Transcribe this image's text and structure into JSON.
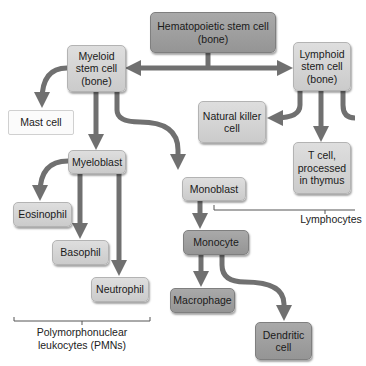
{
  "diagram": {
    "nodes": {
      "hematopoietic": "Hematopoietic stem cell\n(bone)",
      "myeloid": "Myeloid\nstem cell\n(bone)",
      "lymphoid": "Lymphoid\nstem cell\n(bone)",
      "mast_cell": "Mast cell",
      "natural_killer": "Natural killer\ncell",
      "myeloblast": "Myeloblast",
      "monoblast": "Monoblast",
      "t_cell": "T cell,\nprocessed\nin thymus",
      "eosinophil": "Eosinophil",
      "basophil": "Basophil",
      "monocyte": "Monocyte",
      "neutrophil": "Neutrophil",
      "macrophage": "Macrophage",
      "dendritic": "Dendritic\ncell"
    },
    "groups": {
      "lymphocytes": "Lymphocytes",
      "pmns": "Polymorphonuclear\nleukocytes (PMNs)"
    },
    "colors": {
      "arrow": "#707070",
      "light_box": "#d4d4d4",
      "dark_box": "#a0a0a0"
    }
  }
}
